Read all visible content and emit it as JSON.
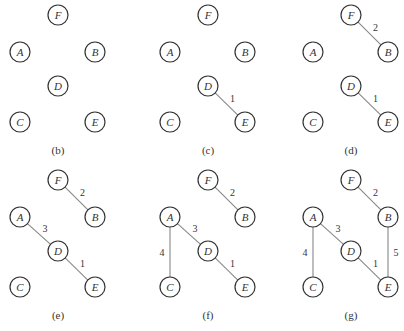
{
  "diagram": {
    "type": "kruskal-minimum-spanning-tree-steps",
    "node_radius": 10,
    "colors": {
      "node_stroke": "#333333",
      "edge": "#888888",
      "text": "#333333"
    },
    "node_layout": {
      "F": [
        38,
        15
      ],
      "A": [
        0,
        52
      ],
      "B": [
        75,
        52
      ],
      "D": [
        38,
        86
      ],
      "C": [
        0,
        122
      ],
      "E": [
        75,
        122
      ]
    },
    "panels": [
      {
        "label": "(b)",
        "origin": [
          20,
          0
        ],
        "edges": []
      },
      {
        "label": "(c)",
        "origin": [
          170,
          0
        ],
        "edges": [
          {
            "from": "D",
            "to": "E",
            "weight": "1"
          }
        ]
      },
      {
        "label": "(d)",
        "origin": [
          313,
          0
        ],
        "edges": [
          {
            "from": "D",
            "to": "E",
            "weight": "1"
          },
          {
            "from": "F",
            "to": "B",
            "weight": "2"
          }
        ]
      },
      {
        "label": "(e)",
        "origin": [
          20,
          165
        ],
        "edges": [
          {
            "from": "D",
            "to": "E",
            "weight": "1"
          },
          {
            "from": "F",
            "to": "B",
            "weight": "2"
          },
          {
            "from": "A",
            "to": "D",
            "weight": "3"
          }
        ]
      },
      {
        "label": "(f)",
        "origin": [
          170,
          165
        ],
        "edges": [
          {
            "from": "D",
            "to": "E",
            "weight": "1"
          },
          {
            "from": "F",
            "to": "B",
            "weight": "2"
          },
          {
            "from": "A",
            "to": "D",
            "weight": "3"
          },
          {
            "from": "A",
            "to": "C",
            "weight": "4"
          }
        ]
      },
      {
        "label": "(g)",
        "origin": [
          313,
          165
        ],
        "edges": [
          {
            "from": "D",
            "to": "E",
            "weight": "1"
          },
          {
            "from": "F",
            "to": "B",
            "weight": "2"
          },
          {
            "from": "A",
            "to": "D",
            "weight": "3"
          },
          {
            "from": "A",
            "to": "C",
            "weight": "4"
          },
          {
            "from": "B",
            "to": "E",
            "weight": "5"
          }
        ]
      }
    ],
    "nodes": [
      "F",
      "A",
      "B",
      "D",
      "C",
      "E"
    ]
  }
}
